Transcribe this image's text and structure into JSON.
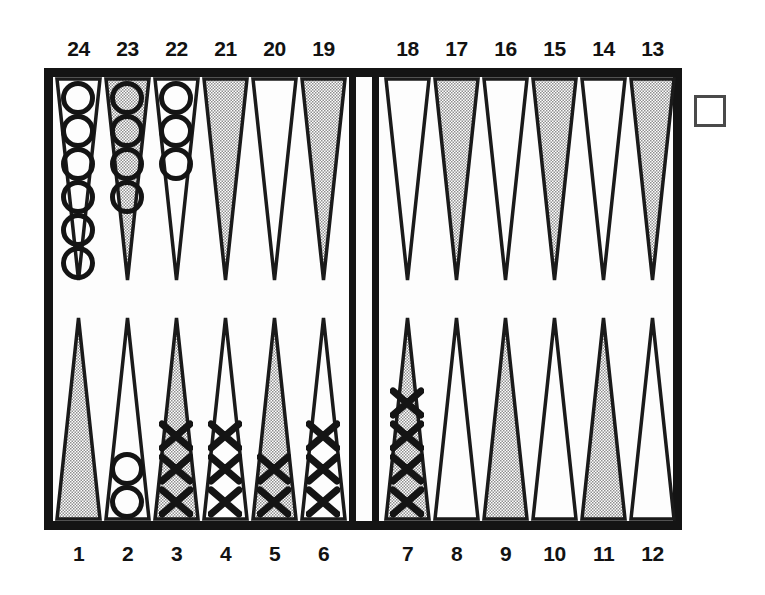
{
  "diagram": {
    "board": {
      "frame_color": "#141414",
      "field_color": "#fdfdfd",
      "shaded_point_color": "#c9c9c9",
      "light_point_color": "#fdfdfd",
      "point_outline_color": "#1a1a1a",
      "checker_outline_color": "#141414"
    },
    "top_labels": [
      "24",
      "23",
      "22",
      "21",
      "20",
      "19",
      "18",
      "17",
      "16",
      "15",
      "14",
      "13"
    ],
    "bottom_labels": [
      "1",
      "2",
      "3",
      "4",
      "5",
      "6",
      "7",
      "8",
      "9",
      "10",
      "11",
      "12"
    ],
    "doubling_cube": {
      "name": "doubling-cube",
      "value": ""
    },
    "points": [
      {
        "number": "24",
        "row": "top",
        "quadrant": "left",
        "slot": 0,
        "shaded": false,
        "checker_type": "O",
        "count": 6
      },
      {
        "number": "23",
        "row": "top",
        "quadrant": "left",
        "slot": 1,
        "shaded": true,
        "checker_type": "O",
        "count": 4
      },
      {
        "number": "22",
        "row": "top",
        "quadrant": "left",
        "slot": 2,
        "shaded": false,
        "checker_type": "O",
        "count": 3
      },
      {
        "number": "21",
        "row": "top",
        "quadrant": "left",
        "slot": 3,
        "shaded": true,
        "checker_type": "",
        "count": 0
      },
      {
        "number": "20",
        "row": "top",
        "quadrant": "left",
        "slot": 4,
        "shaded": false,
        "checker_type": "",
        "count": 0
      },
      {
        "number": "19",
        "row": "top",
        "quadrant": "left",
        "slot": 5,
        "shaded": true,
        "checker_type": "",
        "count": 0
      },
      {
        "number": "18",
        "row": "top",
        "quadrant": "right",
        "slot": 0,
        "shaded": false,
        "checker_type": "",
        "count": 0
      },
      {
        "number": "17",
        "row": "top",
        "quadrant": "right",
        "slot": 1,
        "shaded": true,
        "checker_type": "",
        "count": 0
      },
      {
        "number": "16",
        "row": "top",
        "quadrant": "right",
        "slot": 2,
        "shaded": false,
        "checker_type": "",
        "count": 0
      },
      {
        "number": "15",
        "row": "top",
        "quadrant": "right",
        "slot": 3,
        "shaded": true,
        "checker_type": "",
        "count": 0
      },
      {
        "number": "14",
        "row": "top",
        "quadrant": "right",
        "slot": 4,
        "shaded": false,
        "checker_type": "",
        "count": 0
      },
      {
        "number": "13",
        "row": "top",
        "quadrant": "right",
        "slot": 5,
        "shaded": true,
        "checker_type": "",
        "count": 0
      },
      {
        "number": "1",
        "row": "bottom",
        "quadrant": "left",
        "slot": 0,
        "shaded": true,
        "checker_type": "",
        "count": 0
      },
      {
        "number": "2",
        "row": "bottom",
        "quadrant": "left",
        "slot": 1,
        "shaded": false,
        "checker_type": "O",
        "count": 2
      },
      {
        "number": "3",
        "row": "bottom",
        "quadrant": "left",
        "slot": 2,
        "shaded": true,
        "checker_type": "X",
        "count": 3
      },
      {
        "number": "4",
        "row": "bottom",
        "quadrant": "left",
        "slot": 3,
        "shaded": false,
        "checker_type": "X",
        "count": 3
      },
      {
        "number": "5",
        "row": "bottom",
        "quadrant": "left",
        "slot": 4,
        "shaded": true,
        "checker_type": "X",
        "count": 2
      },
      {
        "number": "6",
        "row": "bottom",
        "quadrant": "left",
        "slot": 5,
        "shaded": false,
        "checker_type": "X",
        "count": 3
      },
      {
        "number": "7",
        "row": "bottom",
        "quadrant": "right",
        "slot": 0,
        "shaded": true,
        "checker_type": "X",
        "count": 4
      },
      {
        "number": "8",
        "row": "bottom",
        "quadrant": "right",
        "slot": 1,
        "shaded": false,
        "checker_type": "",
        "count": 0
      },
      {
        "number": "9",
        "row": "bottom",
        "quadrant": "right",
        "slot": 2,
        "shaded": true,
        "checker_type": "",
        "count": 0
      },
      {
        "number": "10",
        "row": "bottom",
        "quadrant": "right",
        "slot": 3,
        "shaded": false,
        "checker_type": "",
        "count": 0
      },
      {
        "number": "11",
        "row": "bottom",
        "quadrant": "right",
        "slot": 4,
        "shaded": true,
        "checker_type": "",
        "count": 0
      },
      {
        "number": "12",
        "row": "bottom",
        "quadrant": "right",
        "slot": 5,
        "shaded": false,
        "checker_type": "",
        "count": 0
      }
    ],
    "summary": {
      "white_checkers_O": 15,
      "dark_checkers_X": 15
    }
  }
}
